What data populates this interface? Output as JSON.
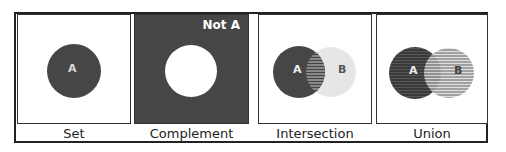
{
  "panels": [
    {
      "caption": "Set",
      "label_a": "A"
    },
    {
      "caption": "Complement",
      "label": "Not A"
    },
    {
      "caption": "Intersection",
      "label_a": "A",
      "label_b": "B"
    },
    {
      "caption": "Union",
      "label_a": "A",
      "label_b": "B"
    }
  ],
  "colors": {
    "dark": "#464646",
    "light": "#e4e4e4",
    "border": "#222222",
    "background": "#ffffff"
  }
}
